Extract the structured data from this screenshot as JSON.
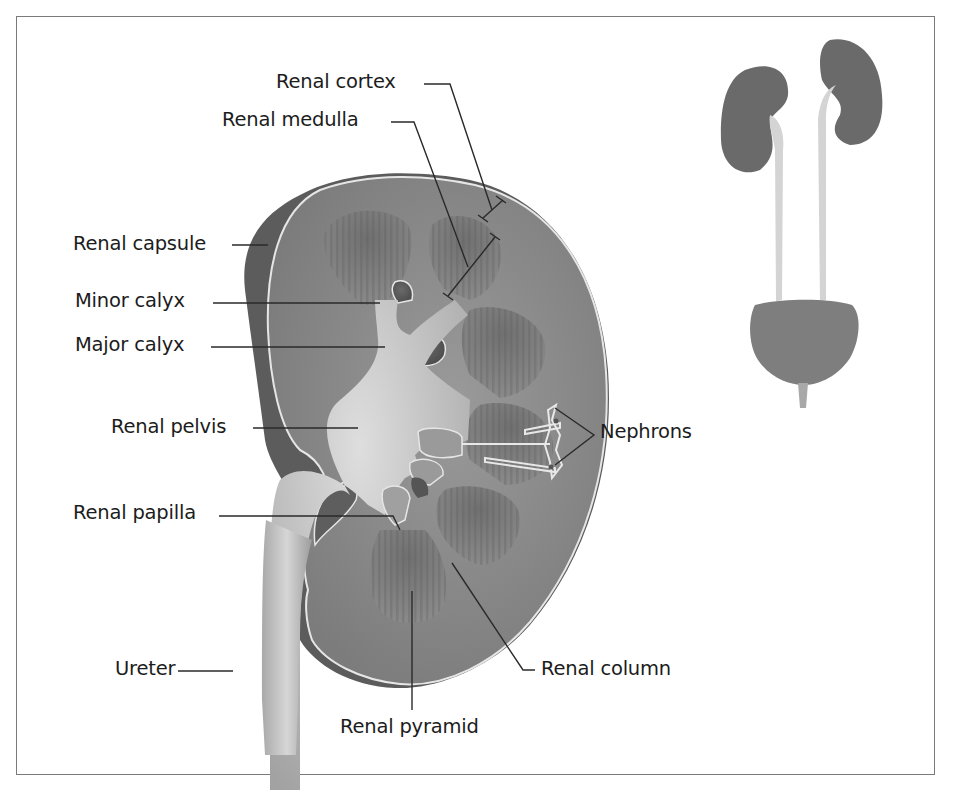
{
  "diagram": {
    "title": "",
    "colors": {
      "frame": "#7a7a7a",
      "tissue_cortex": "#8e8e8e",
      "tissue_dark": "#5a5a5a",
      "pyramid": "#6e6e6e",
      "pelvis": "#c8c8c8",
      "outline_light": "#e6e6e6",
      "label_text": "#1c1c1c",
      "leader_line": "#2a2a2a"
    },
    "labels": {
      "renal_cortex": "Renal cortex",
      "renal_medulla": "Renal medulla",
      "renal_capsule": "Renal capsule",
      "minor_calyx": "Minor calyx",
      "major_calyx": "Major calyx",
      "renal_pelvis": "Renal pelvis",
      "nephrons": "Nephrons",
      "renal_papilla": "Renal papilla",
      "ureter": "Ureter",
      "renal_column": "Renal column",
      "renal_pyramid": "Renal pyramid"
    },
    "inset": {
      "description": "Urinary system: two kidneys, two ureters, bladder, urethra"
    }
  }
}
